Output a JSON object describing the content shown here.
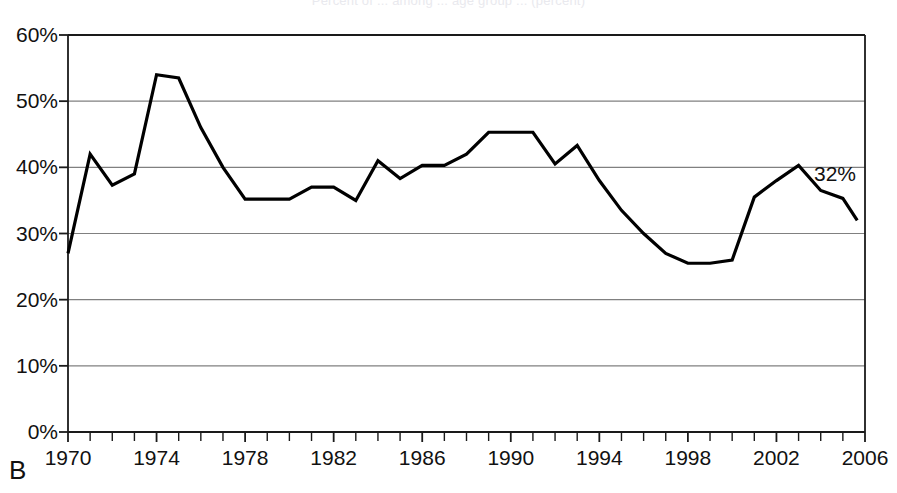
{
  "figure": {
    "panel_label": "B",
    "faint_title": "Percent of ... among ... age group ... (percent)"
  },
  "annotations": [
    {
      "name": "endpoint-value",
      "text": "32%",
      "x_year": 2006.05,
      "y_value": 36.0
    }
  ],
  "chart_data": {
    "type": "line",
    "title": "",
    "xlabel": "",
    "ylabel": "",
    "xlim": [
      1970,
      2006
    ],
    "ylim": [
      0,
      60
    ],
    "grid": "horizontal",
    "legend": "none",
    "y_tick_labels": [
      "0%",
      "10%",
      "20%",
      "30%",
      "40%",
      "50%",
      "60%"
    ],
    "y_ticks": [
      0,
      10,
      20,
      30,
      40,
      50,
      60
    ],
    "x_tick_labels": [
      "1970",
      "1974",
      "1978",
      "1982",
      "1986",
      "1990",
      "1994",
      "1998",
      "2002",
      "2006"
    ],
    "x_ticks": [
      1970,
      1974,
      1978,
      1982,
      1986,
      1990,
      1994,
      1998,
      2002,
      2006
    ],
    "x_minor_tick_step": 1,
    "line_color": "#000000",
    "line_width": 3.2,
    "x": [
      1970,
      1971,
      1972,
      1973,
      1974,
      1975,
      1976,
      1977,
      1978,
      1979,
      1980,
      1981,
      1982,
      1983,
      1984,
      1985,
      1986,
      1987,
      1988,
      1989,
      1990,
      1991,
      1992,
      1993,
      1994,
      1995,
      1996,
      1997,
      1998,
      1999,
      2000,
      2001,
      2002,
      2003,
      2004,
      2005
    ],
    "values": [
      27.0,
      42.0,
      37.3,
      39.0,
      54.0,
      53.5,
      46.0,
      40.0,
      35.2,
      35.2,
      35.2,
      37.0,
      37.0,
      35.0,
      41.0,
      38.3,
      40.3,
      40.3,
      42.0,
      45.3,
      45.3,
      45.3,
      40.5,
      43.3,
      38.0,
      33.5,
      30.0,
      27.0,
      25.5,
      25.5,
      26.0,
      35.5,
      38.0,
      40.3,
      36.5,
      35.3
    ],
    "final_value": 32.0
  }
}
